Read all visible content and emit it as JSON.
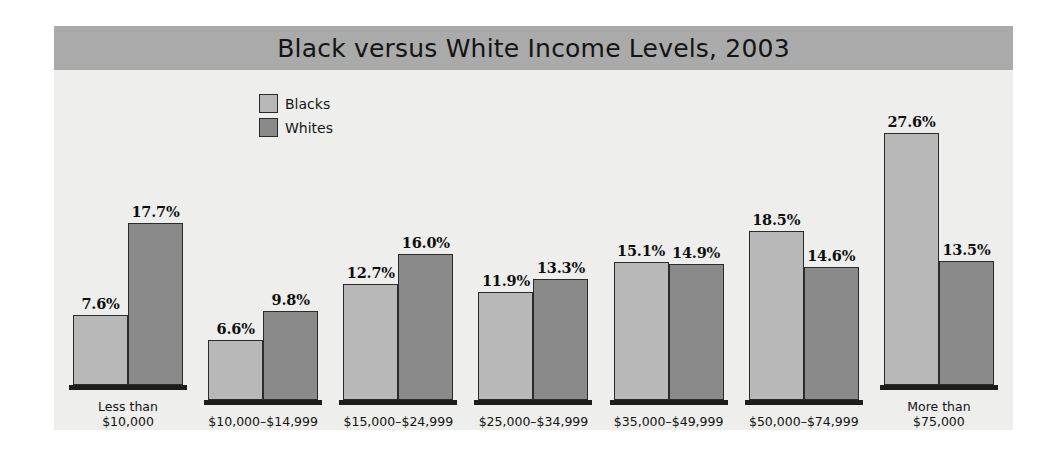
{
  "chart_data": {
    "type": "bar",
    "title": "Black versus White Income Levels, 2003",
    "xlabel": "",
    "ylabel": "",
    "ylim": [
      0,
      30
    ],
    "grid": false,
    "legend_position": "top-left-inside",
    "value_suffix": "%",
    "categories": [
      "Less than\n$10,000",
      "$10,000–$14,999",
      "$15,000–$24,999",
      "$25,000–$34,999",
      "$35,000–$49,999",
      "$50,000–$74,999",
      "More than\n$75,000"
    ],
    "series": [
      {
        "name": "Blacks",
        "color": "#b8b8b8",
        "values": [
          7.6,
          6.6,
          12.7,
          11.9,
          15.1,
          18.5,
          27.6
        ],
        "labels": [
          "7.6%",
          "6.6%",
          "12.7%",
          "11.9%",
          "15.1%",
          "18.5%",
          "27.6%"
        ]
      },
      {
        "name": "Whites",
        "color": "#8a8a8a",
        "values": [
          17.7,
          9.8,
          16.0,
          13.3,
          14.9,
          14.6,
          13.5
        ],
        "labels": [
          "17.7%",
          "9.8%",
          "16.0%",
          "13.3%",
          "14.9%",
          "14.6%",
          "13.5%"
        ]
      }
    ]
  },
  "colors": {
    "title_bar": "#aaaaaa",
    "panel_background": "#eeeeec",
    "blacks_bar": "#b8b8b8",
    "whites_bar": "#8a8a8a",
    "bar_outline": "#2b2b2b",
    "axis": "#1d1d1d",
    "text": "#131313"
  }
}
